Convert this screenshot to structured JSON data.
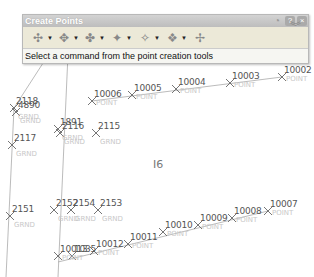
{
  "window": {
    "title": "Create Points",
    "buttons": {
      "pin": "pin-icon",
      "help": "?",
      "close": "×"
    },
    "status_text": "Select a command from the point creation tools"
  },
  "toolbar": {
    "tools": [
      {
        "name": "miscellaneous-points",
        "icon": "✣",
        "has_dropdown": true
      },
      {
        "name": "intersection-points",
        "icon": "✥",
        "has_dropdown": true
      },
      {
        "name": "alignment-points",
        "icon": "✤",
        "has_dropdown": true
      },
      {
        "name": "surface-points",
        "icon": "✦",
        "has_dropdown": true
      },
      {
        "name": "interpolate-points",
        "icon": "✧",
        "has_dropdown": true
      },
      {
        "name": "slope-points",
        "icon": "❖",
        "has_dropdown": true
      },
      {
        "name": "import-points",
        "icon": "✢",
        "has_dropdown": false
      }
    ],
    "expand_icon": "chevron-double-down"
  },
  "drawing": {
    "center_label": "I6",
    "points": [
      {
        "num": "10002",
        "desc": "POINT",
        "x": 282,
        "y": 77
      },
      {
        "num": "10003",
        "desc": "POINT",
        "x": 230,
        "y": 83
      },
      {
        "num": "10004",
        "desc": "POINT",
        "x": 176,
        "y": 89
      },
      {
        "num": "10005",
        "desc": "POINT",
        "x": 132,
        "y": 95
      },
      {
        "num": "10006",
        "desc": "POINT",
        "x": 92,
        "y": 101
      },
      {
        "num": "2118",
        "desc": "GRND",
        "x": 14,
        "y": 108
      },
      {
        "num": "4890",
        "desc": "GRND",
        "x": 16,
        "y": 112
      },
      {
        "num": "2117",
        "desc": "GRND",
        "x": 12,
        "y": 145
      },
      {
        "num": "1891",
        "desc": "GRND",
        "x": 58,
        "y": 129
      },
      {
        "num": "2116",
        "desc": "GRND",
        "x": 60,
        "y": 133
      },
      {
        "num": "2115",
        "desc": "GRND",
        "x": 96,
        "y": 133
      },
      {
        "num": "2151",
        "desc": "GRND",
        "x": 10,
        "y": 216
      },
      {
        "num": "2152",
        "desc": "GRND",
        "x": 54,
        "y": 210
      },
      {
        "num": "2154",
        "desc": "GRND",
        "x": 71,
        "y": 210
      },
      {
        "num": "2153",
        "desc": "GRND",
        "x": 98,
        "y": 210
      },
      {
        "num": "10007",
        "desc": "POINT",
        "x": 268,
        "y": 211
      },
      {
        "num": "10008",
        "desc": "POINT",
        "x": 232,
        "y": 218
      },
      {
        "num": "10009",
        "desc": "POINT",
        "x": 198,
        "y": 225
      },
      {
        "num": "10010",
        "desc": "POINT",
        "x": 163,
        "y": 232
      },
      {
        "num": "10011",
        "desc": "POINT",
        "x": 128,
        "y": 244
      },
      {
        "num": "10012",
        "desc": "POINT",
        "x": 94,
        "y": 251
      },
      {
        "num": "10013",
        "desc": "POINT",
        "x": 58,
        "y": 256
      },
      {
        "num": "1035",
        "desc": "",
        "x": 72,
        "y": 256
      }
    ]
  }
}
